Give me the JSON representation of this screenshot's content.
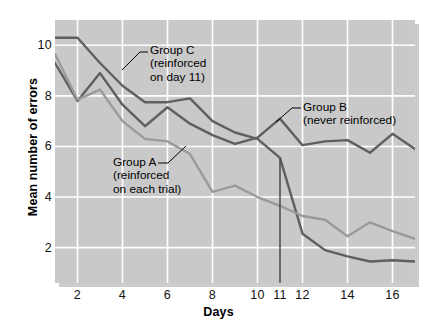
{
  "chart_data": {
    "type": "line",
    "title": "",
    "xlabel": "Days",
    "ylabel": "Mean number of errors",
    "xlim": [
      1,
      17
    ],
    "ylim": [
      0.6,
      11.0
    ],
    "grid": true,
    "legend_position": "inline-annotations",
    "y_ticks": [
      10,
      8,
      6,
      4,
      2
    ],
    "x_ticks": [
      2,
      4,
      6,
      8,
      10,
      11,
      12,
      14,
      16
    ],
    "x": [
      1,
      2,
      3,
      4,
      5,
      6,
      7,
      8,
      9,
      10,
      11,
      12,
      13,
      14,
      15,
      16,
      17
    ],
    "series": [
      {
        "name": "Group C",
        "annotation": "Group C (reinforced on day 11)",
        "color": "#5f5f5f",
        "values": [
          10.3,
          10.3,
          9.3,
          8.4,
          7.75,
          7.75,
          7.9,
          7.0,
          6.55,
          6.3,
          5.55,
          2.55,
          1.9,
          1.65,
          1.45,
          1.5,
          1.45
        ]
      },
      {
        "name": "Group B",
        "annotation": "Group B (never reinforced)",
        "color": "#5f5f5f",
        "values": [
          9.3,
          7.8,
          8.9,
          7.65,
          6.8,
          7.55,
          6.9,
          6.45,
          6.1,
          6.35,
          7.1,
          6.05,
          6.2,
          6.25,
          5.75,
          6.5,
          5.9
        ]
      },
      {
        "name": "Group A",
        "annotation": "Group A (reinforced on each trial)",
        "color": "#9a9a9a",
        "values": [
          9.65,
          7.85,
          8.25,
          7.0,
          6.3,
          6.2,
          5.7,
          4.2,
          4.45,
          4.0,
          3.65,
          3.25,
          3.1,
          2.45,
          3.0,
          2.65,
          2.35
        ]
      }
    ],
    "marker_line": {
      "name": "day-11-marker",
      "x": 11,
      "y_top": 5.55,
      "y_bottom": 0.6,
      "color": "#4a4a4a"
    },
    "colors": {
      "plot_background": "#c9c9c9",
      "grid": "#ffffff",
      "page_background": "#ffffff",
      "text": "#000000"
    }
  },
  "axes": {
    "y_title": "Mean number of errors",
    "x_title": "Days",
    "y_tick_labels": [
      "10",
      "8",
      "6",
      "4",
      "2"
    ],
    "x_tick_labels": [
      "2",
      "4",
      "6",
      "8",
      "10",
      "11",
      "12",
      "14",
      "16"
    ]
  },
  "annotations": {
    "group_c": {
      "line1": "Group C",
      "line2": "(reinforced",
      "line3": "on day 11)"
    },
    "group_b": {
      "line1": "Group B",
      "line2": "(never reinforced)"
    },
    "group_a": {
      "line1": "Group A",
      "line2": "(reinforced",
      "line3": "on each trial)"
    }
  }
}
